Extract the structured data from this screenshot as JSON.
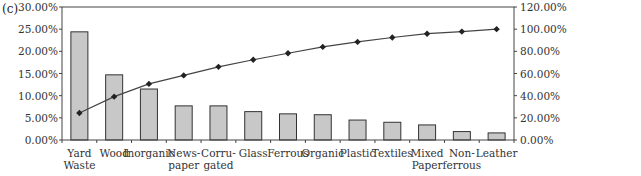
{
  "panel_label": "(c)",
  "chart_data": {
    "type": "bar",
    "subtype": "pareto",
    "title": "",
    "xlabel": "",
    "ylabel": "",
    "categories": [
      [
        "Yard",
        "Waste"
      ],
      [
        "Wood"
      ],
      [
        "Inorganic"
      ],
      [
        "News-",
        "paper"
      ],
      [
        "Corru-",
        "gated"
      ],
      [
        "Glass"
      ],
      [
        "Ferrous"
      ],
      [
        "Organic"
      ],
      [
        "Plastic"
      ],
      [
        "Textiles"
      ],
      [
        "Mixed",
        "Paper"
      ],
      [
        "Non-",
        "ferrous"
      ],
      [
        "Leather"
      ]
    ],
    "series": [
      {
        "name": "Percent",
        "kind": "bar",
        "axis": "left",
        "color": "#c8c8c8",
        "values": [
          24.4,
          14.7,
          11.5,
          7.7,
          7.7,
          6.4,
          5.9,
          5.7,
          4.5,
          4.0,
          3.4,
          1.9,
          1.6
        ]
      },
      {
        "name": "Cumulative Percent",
        "kind": "line",
        "axis": "right",
        "color": "#222222",
        "marker": "diamond",
        "values": [
          24.4,
          39.1,
          50.6,
          58.3,
          66.0,
          72.4,
          78.3,
          84.0,
          88.5,
          92.5,
          95.9,
          97.8,
          100.0
        ]
      }
    ],
    "left_axis": {
      "ylim": [
        0,
        30
      ],
      "ticks": [
        "0.00%",
        "5.00%",
        "10.00%",
        "15.00%",
        "20.00%",
        "25.00%",
        "30.00%"
      ]
    },
    "right_axis": {
      "ylim": [
        0,
        120
      ],
      "ticks": [
        "0.00%",
        "20.00%",
        "40.00%",
        "60.00%",
        "80.00%",
        "100.00%",
        "120.00%"
      ]
    },
    "grid": false,
    "legend": "none"
  }
}
